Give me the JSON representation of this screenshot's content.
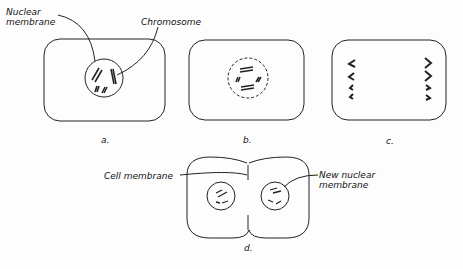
{
  "diagram": {
    "panels": [
      {
        "id": "a",
        "caption": "a.",
        "labels": [
          "Nuclear membrane",
          "Chromosome"
        ]
      },
      {
        "id": "b",
        "caption": "b.",
        "labels": []
      },
      {
        "id": "c",
        "caption": "c.",
        "labels": []
      },
      {
        "id": "d",
        "caption": "d.",
        "labels": [
          "Cell membrane",
          "New nuclear membrane"
        ]
      }
    ],
    "labels": {
      "nuclear_line1": "Nuclear",
      "nuclear_line2": "membrane",
      "chromosome": "Chromosome",
      "cell_membrane": "Cell membrane",
      "new_nuclear_line1": "New nuclear",
      "new_nuclear_line2": "membrane"
    },
    "captions": {
      "a": "a.",
      "b": "b.",
      "c": "c.",
      "d": "d."
    },
    "colors": {
      "stroke": "#222222",
      "background": "#fdfdfd"
    }
  }
}
